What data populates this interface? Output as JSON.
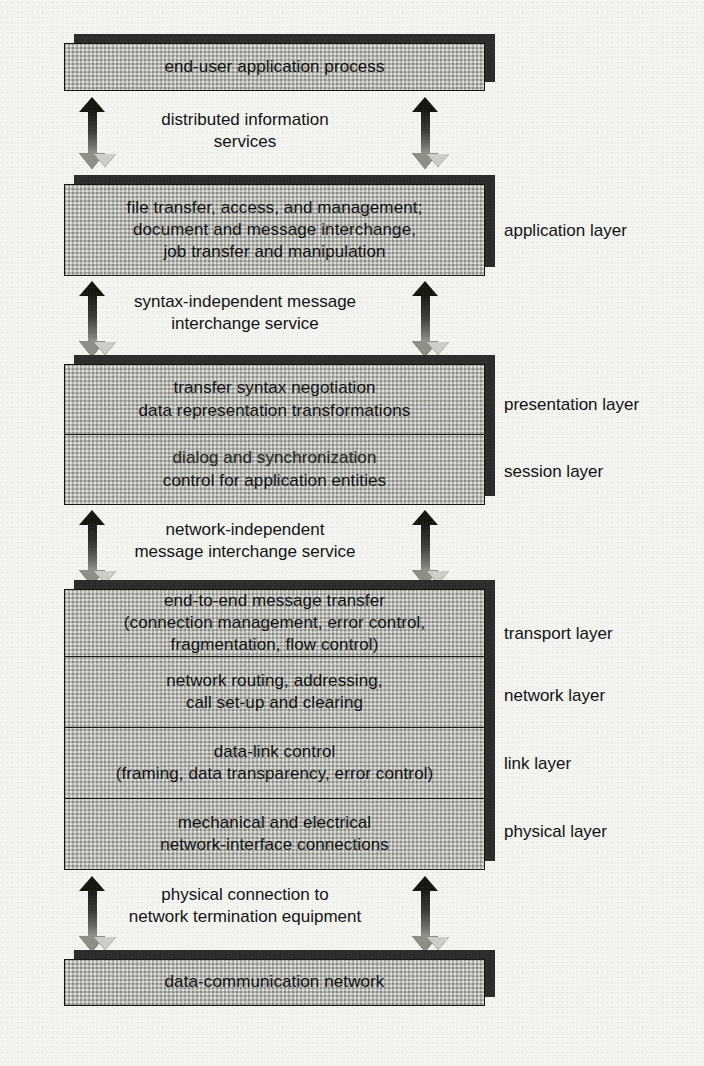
{
  "diagram": {
    "page_background": "#f4f4f1",
    "box_fill": "#b6b6b1",
    "box_border": "#15150f",
    "shadow_color": "#2b2b29"
  },
  "boxes": {
    "top": {
      "name": "end-user application process",
      "lines": [
        "end-user application process"
      ]
    },
    "application": {
      "lines": [
        "file transfer, access, and management;",
        "document and message interchange,",
        "job transfer and manipulation"
      ],
      "layer_label": "application layer"
    },
    "presentation": {
      "lines": [
        "transfer syntax negotiation",
        "data representation transformations"
      ],
      "layer_label": "presentation layer"
    },
    "session": {
      "lines": [
        "dialog and synchronization",
        "control for application entities"
      ],
      "layer_label": "session layer"
    },
    "transport": {
      "lines": [
        "end-to-end message transfer",
        "(connection management, error control,",
        "fragmentation, flow control)"
      ],
      "layer_label": "transport layer"
    },
    "network": {
      "lines": [
        "network routing, addressing,",
        "call set-up and clearing"
      ],
      "layer_label": "network layer"
    },
    "link": {
      "lines": [
        "data-link control",
        "(framing, data transparency, error control)"
      ],
      "layer_label": "link layer"
    },
    "physical": {
      "lines": [
        "mechanical and electrical",
        "network-interface connections"
      ],
      "layer_label": "physical layer"
    },
    "bottom": {
      "lines": [
        "data-communication network"
      ]
    }
  },
  "captions": {
    "distributed": {
      "lines": [
        "distributed information",
        "services"
      ]
    },
    "syntax": {
      "lines": [
        "syntax-independent message",
        "interchange service"
      ]
    },
    "network_independent": {
      "lines": [
        "network-independent",
        "message interchange service"
      ]
    },
    "physical_connection": {
      "lines": [
        "physical connection to",
        "network termination equipment"
      ]
    }
  },
  "arrows": {
    "count": 8,
    "style": "vertical double-headed",
    "up_head_color": "#16160f",
    "down_head_color": "#cfcfc9"
  }
}
